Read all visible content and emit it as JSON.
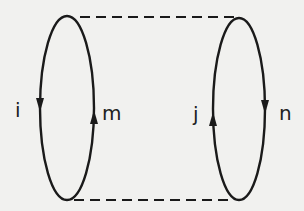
{
  "diagram": {
    "type": "feynman-loop-diagram",
    "line_color": "#1a1a1a",
    "background": "#f1f1ef",
    "loops": [
      {
        "id": "left",
        "labels": {
          "left": "i",
          "right": "m"
        },
        "arrows": {
          "left": "down",
          "right": "up"
        }
      },
      {
        "id": "right",
        "labels": {
          "left": "j",
          "right": "n"
        },
        "arrows": {
          "left": "up",
          "right": "down"
        }
      }
    ],
    "connections": [
      {
        "style": "dashed",
        "position": "top"
      },
      {
        "style": "dashed",
        "position": "bottom"
      }
    ]
  }
}
